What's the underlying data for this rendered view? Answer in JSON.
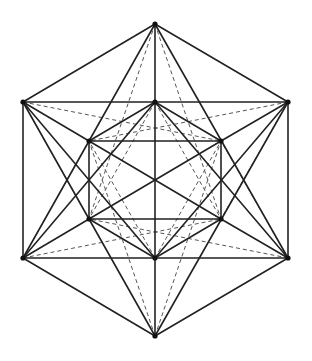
{
  "diagram": {
    "type": "polyhedron-projection",
    "canvas": {
      "width": 312,
      "height": 361
    },
    "colors": {
      "solid": "#222222",
      "dashed": "#555555",
      "vertex": "#111111",
      "background": "#ffffff"
    },
    "vertices": {
      "top": [
        155,
        24
      ],
      "outer_upper_left": [
        23,
        102
      ],
      "outer_upper_right": [
        288,
        102
      ],
      "outer_lower_left": [
        23,
        258
      ],
      "outer_lower_right": [
        288,
        258
      ],
      "bottom": [
        155,
        336
      ],
      "inner_top": [
        155,
        102
      ],
      "inner_upper_left": [
        89,
        141
      ],
      "inner_upper_right": [
        221,
        141
      ],
      "inner_lower_left": [
        89,
        219
      ],
      "inner_lower_right": [
        221,
        219
      ],
      "inner_bottom": [
        155,
        258
      ]
    },
    "solid_edges": [
      [
        "top",
        "outer_upper_left"
      ],
      [
        "top",
        "outer_upper_right"
      ],
      [
        "top",
        "inner_top"
      ],
      [
        "top",
        "outer_lower_left"
      ],
      [
        "top",
        "outer_lower_right"
      ],
      [
        "outer_upper_left",
        "outer_upper_right"
      ],
      [
        "outer_upper_left",
        "outer_lower_left"
      ],
      [
        "outer_upper_right",
        "outer_lower_right"
      ],
      [
        "outer_lower_left",
        "outer_lower_right"
      ],
      [
        "bottom",
        "outer_lower_left"
      ],
      [
        "bottom",
        "outer_lower_right"
      ],
      [
        "bottom",
        "inner_bottom"
      ],
      [
        "bottom",
        "outer_upper_left"
      ],
      [
        "bottom",
        "outer_upper_right"
      ],
      [
        "inner_top",
        "inner_bottom"
      ],
      [
        "inner_top",
        "inner_upper_left"
      ],
      [
        "inner_top",
        "inner_upper_right"
      ],
      [
        "inner_bottom",
        "inner_lower_left"
      ],
      [
        "inner_bottom",
        "inner_lower_right"
      ],
      [
        "inner_upper_left",
        "inner_upper_right"
      ],
      [
        "inner_lower_left",
        "inner_lower_right"
      ],
      [
        "inner_upper_left",
        "inner_lower_left"
      ],
      [
        "inner_upper_right",
        "inner_lower_right"
      ],
      [
        "inner_upper_left",
        "inner_lower_right"
      ],
      [
        "inner_lower_left",
        "inner_upper_right"
      ],
      [
        "outer_upper_left",
        "inner_upper_left"
      ],
      [
        "outer_upper_right",
        "inner_upper_right"
      ],
      [
        "outer_lower_left",
        "inner_lower_left"
      ],
      [
        "outer_lower_right",
        "inner_lower_right"
      ],
      [
        "outer_upper_left",
        "inner_bottom"
      ],
      [
        "outer_upper_right",
        "inner_bottom"
      ],
      [
        "outer_lower_left",
        "inner_top"
      ],
      [
        "outer_lower_right",
        "inner_top"
      ]
    ],
    "dashed_edges": [
      [
        "top",
        "inner_lower_left"
      ],
      [
        "top",
        "inner_lower_right"
      ],
      [
        "bottom",
        "inner_upper_left"
      ],
      [
        "bottom",
        "inner_upper_right"
      ],
      [
        "outer_upper_left",
        "inner_upper_right"
      ],
      [
        "outer_upper_right",
        "inner_upper_left"
      ],
      [
        "outer_lower_left",
        "inner_lower_right"
      ],
      [
        "outer_lower_right",
        "inner_lower_left"
      ],
      [
        "outer_upper_left",
        "inner_lower_left"
      ],
      [
        "outer_upper_right",
        "inner_lower_right"
      ],
      [
        "outer_lower_left",
        "inner_upper_left"
      ],
      [
        "outer_lower_right",
        "inner_upper_right"
      ],
      [
        "inner_top",
        "inner_lower_left"
      ],
      [
        "inner_top",
        "inner_lower_right"
      ],
      [
        "inner_bottom",
        "inner_upper_left"
      ],
      [
        "inner_bottom",
        "inner_upper_right"
      ]
    ],
    "vertex_radius": 2.6
  }
}
